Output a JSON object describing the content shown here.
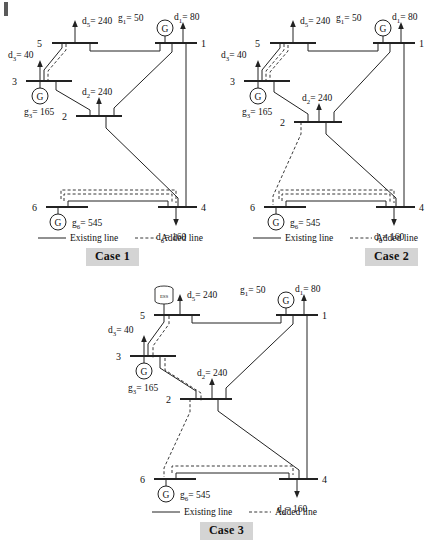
{
  "figure": {
    "kind": "power-system-single-line-diagram",
    "bottom_caption": ""
  },
  "legend": {
    "existing": "Existing line",
    "added": "Added line"
  },
  "cases": [
    {
      "id": "case1",
      "label": "Case 1",
      "buses": [
        {
          "name": "1",
          "label": "1"
        },
        {
          "name": "2",
          "label": "2"
        },
        {
          "name": "3",
          "label": "3"
        },
        {
          "name": "4",
          "label": "4"
        },
        {
          "name": "5",
          "label": "5"
        },
        {
          "name": "6",
          "label": "6"
        }
      ],
      "generators": [
        {
          "bus": "1",
          "symbol": "G",
          "label": "g",
          "sub": "1",
          "value": "= 50",
          "full": "g1 = 50"
        },
        {
          "bus": "3",
          "symbol": "G",
          "label": "g",
          "sub": "3",
          "value": "= 165",
          "full": "g3 = 165"
        },
        {
          "bus": "6",
          "symbol": "G",
          "label": "g",
          "sub": "6",
          "value": "= 545",
          "full": "g6 = 545"
        }
      ],
      "demands": [
        {
          "bus": "1",
          "label": "d",
          "sub": "1",
          "value": "= 80",
          "full": "d1 = 80"
        },
        {
          "bus": "2",
          "label": "d",
          "sub": "2",
          "value": "= 240",
          "full": "d2 = 240"
        },
        {
          "bus": "3",
          "label": "d",
          "sub": "3",
          "value": "= 40",
          "full": "d3 = 40"
        },
        {
          "bus": "5",
          "label": "d",
          "sub": "5",
          "value": "= 240",
          "full": "d5 = 240"
        },
        {
          "bus": "6",
          "label": "d",
          "sub": "6",
          "value": "= 160",
          "full": "d6 = 160"
        }
      ],
      "existing_lines": [
        {
          "from": "1",
          "to": "5"
        },
        {
          "from": "1",
          "to": "2"
        },
        {
          "from": "1",
          "to": "4"
        },
        {
          "from": "3",
          "to": "5"
        },
        {
          "from": "3",
          "to": "2"
        },
        {
          "from": "2",
          "to": "4"
        },
        {
          "from": "6",
          "to": "4"
        }
      ],
      "added_lines": [
        {
          "from": "3",
          "to": "5",
          "count": 1
        },
        {
          "from": "6",
          "to": "4",
          "count": 2
        }
      ],
      "storage": []
    },
    {
      "id": "case2",
      "label": "Case 2",
      "buses": [
        {
          "name": "1",
          "label": "1"
        },
        {
          "name": "2",
          "label": "2"
        },
        {
          "name": "3",
          "label": "3"
        },
        {
          "name": "4",
          "label": "4"
        },
        {
          "name": "5",
          "label": "5"
        },
        {
          "name": "6",
          "label": "6"
        }
      ],
      "generators": [
        {
          "bus": "1",
          "symbol": "G",
          "label": "g",
          "sub": "1",
          "value": "= 50",
          "full": "g1 = 50"
        },
        {
          "bus": "3",
          "symbol": "G",
          "label": "g",
          "sub": "3",
          "value": "= 165",
          "full": "g3 = 165"
        },
        {
          "bus": "6",
          "symbol": "G",
          "label": "g",
          "sub": "6",
          "value": "= 545",
          "full": "g6 = 545"
        }
      ],
      "demands": [
        {
          "bus": "1",
          "label": "d",
          "sub": "1",
          "value": "= 80",
          "full": "d1 = 80"
        },
        {
          "bus": "2",
          "label": "d",
          "sub": "2",
          "value": "= 240",
          "full": "d2 = 240"
        },
        {
          "bus": "3",
          "label": "d",
          "sub": "3",
          "value": "= 40",
          "full": "d3 = 40"
        },
        {
          "bus": "5",
          "label": "d",
          "sub": "5",
          "value": "= 240",
          "full": "d5 = 240"
        },
        {
          "bus": "6",
          "label": "d",
          "sub": "6",
          "value": "= 160",
          "full": "d6 = 160"
        }
      ],
      "existing_lines": [
        {
          "from": "1",
          "to": "5"
        },
        {
          "from": "1",
          "to": "2"
        },
        {
          "from": "1",
          "to": "4"
        },
        {
          "from": "3",
          "to": "5"
        },
        {
          "from": "3",
          "to": "2"
        },
        {
          "from": "2",
          "to": "4"
        },
        {
          "from": "6",
          "to": "4"
        }
      ],
      "added_lines": [
        {
          "from": "3",
          "to": "5",
          "count": 2
        },
        {
          "from": "2",
          "to": "6",
          "count": 1
        },
        {
          "from": "6",
          "to": "4",
          "count": 2
        }
      ],
      "storage": []
    },
    {
      "id": "case3",
      "label": "Case 3",
      "buses": [
        {
          "name": "1",
          "label": "1"
        },
        {
          "name": "2",
          "label": "2"
        },
        {
          "name": "3",
          "label": "3"
        },
        {
          "name": "4",
          "label": "4"
        },
        {
          "name": "5",
          "label": "5"
        },
        {
          "name": "6",
          "label": "6"
        }
      ],
      "generators": [
        {
          "bus": "1",
          "symbol": "G",
          "label": "g",
          "sub": "1",
          "value": "= 50",
          "full": "g1 = 50"
        },
        {
          "bus": "3",
          "symbol": "G",
          "label": "g",
          "sub": "3",
          "value": "= 165",
          "full": "g3 = 165"
        },
        {
          "bus": "6",
          "symbol": "G",
          "label": "g",
          "sub": "6",
          "value": "= 545",
          "full": "g6 = 545"
        }
      ],
      "demands": [
        {
          "bus": "1",
          "label": "d",
          "sub": "1",
          "value": "= 80",
          "full": "d1 = 80"
        },
        {
          "bus": "2",
          "label": "d",
          "sub": "2",
          "value": "= 240",
          "full": "d2 = 240"
        },
        {
          "bus": "3",
          "label": "d",
          "sub": "3",
          "value": "= 40",
          "full": "d3 = 40"
        },
        {
          "bus": "5",
          "label": "d",
          "sub": "5",
          "value": "= 240",
          "full": "d5 = 240"
        },
        {
          "bus": "6",
          "label": "d",
          "sub": "6",
          "value": "= 160",
          "full": "d6 = 160"
        }
      ],
      "existing_lines": [
        {
          "from": "1",
          "to": "5"
        },
        {
          "from": "1",
          "to": "2"
        },
        {
          "from": "1",
          "to": "4"
        },
        {
          "from": "3",
          "to": "5"
        },
        {
          "from": "3",
          "to": "2"
        },
        {
          "from": "2",
          "to": "4"
        },
        {
          "from": "6",
          "to": "4"
        }
      ],
      "added_lines": [
        {
          "from": "3",
          "to": "5",
          "count": 1
        },
        {
          "from": "3",
          "to": "2",
          "count": 1
        },
        {
          "from": "2",
          "to": "6",
          "count": 1
        },
        {
          "from": "6",
          "to": "4",
          "count": 1
        }
      ],
      "storage": [
        {
          "bus": "5",
          "label": "ESS"
        }
      ]
    }
  ]
}
